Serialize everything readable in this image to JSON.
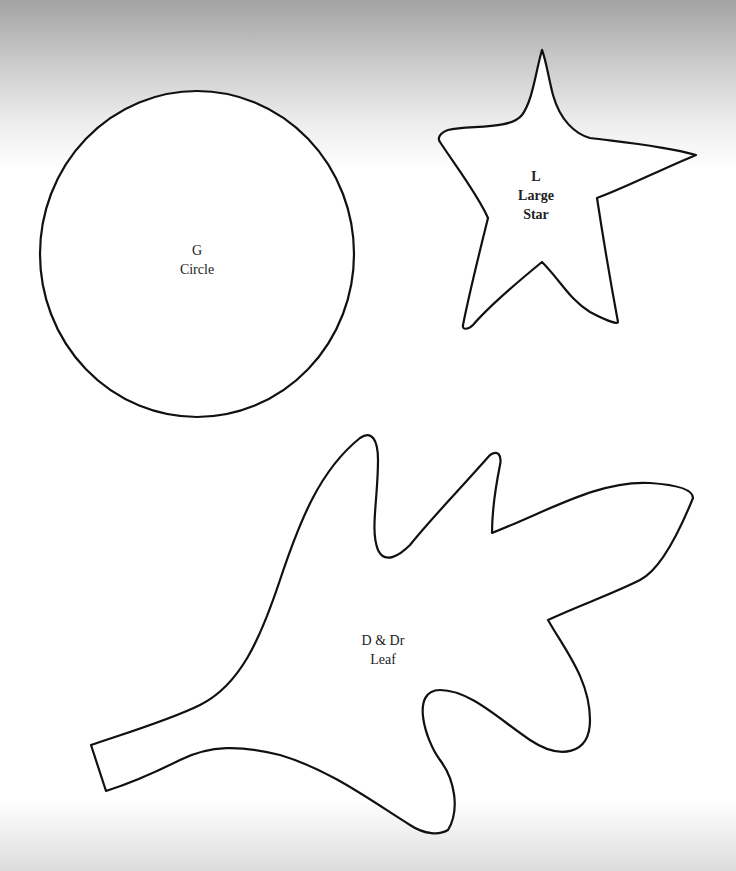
{
  "page": {
    "background": "#ffffff",
    "top_shade": "#a3a3a3",
    "stroke_color": "#111111"
  },
  "shapes": [
    {
      "id": "circle",
      "kind": "circle",
      "code": "G",
      "name": "Circle"
    },
    {
      "id": "large-star",
      "kind": "star",
      "code": "L",
      "name_line1": "Large",
      "name_line2": "Star"
    },
    {
      "id": "leaf",
      "kind": "leaf",
      "code": "D & Dr",
      "name": "Leaf"
    }
  ]
}
